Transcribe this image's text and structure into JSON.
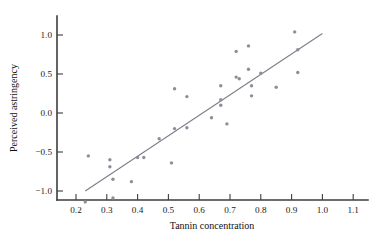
{
  "chart_data": {
    "type": "scatter",
    "title": "",
    "xlabel": "Tannin concentration",
    "ylabel": "Perceived astringency",
    "xlim": [
      0.15,
      1.17
    ],
    "ylim": [
      -1.25,
      1.18
    ],
    "xticks": [
      0.2,
      0.3,
      0.4,
      0.5,
      0.6,
      0.7,
      0.8,
      0.9,
      1.0,
      1.1
    ],
    "xticklabels": [
      "0.2",
      "0.3",
      "0.4",
      "0.5",
      "0.6",
      "0.7",
      "0.8",
      "0.9",
      "1.0",
      "1.1"
    ],
    "yticks": [
      1.0,
      0.5,
      0.0,
      -0.5,
      -1.0
    ],
    "yticklabels": [
      "1.0",
      "0.5",
      "0.0",
      "−0.5",
      "−1.0"
    ],
    "grid": false,
    "legend": false,
    "point_color": "#8b8f9a",
    "line_color": "#7b7f8a",
    "axis_color": "#3d3d3d",
    "points": [
      {
        "x": 0.24,
        "y": -0.55
      },
      {
        "x": 0.23,
        "y": -1.14
      },
      {
        "x": 0.31,
        "y": -0.6
      },
      {
        "x": 0.31,
        "y": -0.69
      },
      {
        "x": 0.32,
        "y": -0.85
      },
      {
        "x": 0.32,
        "y": -1.09
      },
      {
        "x": 0.38,
        "y": -0.88
      },
      {
        "x": 0.4,
        "y": -0.57
      },
      {
        "x": 0.42,
        "y": -0.57
      },
      {
        "x": 0.47,
        "y": -0.33
      },
      {
        "x": 0.51,
        "y": -0.64
      },
      {
        "x": 0.52,
        "y": 0.31
      },
      {
        "x": 0.52,
        "y": -0.2
      },
      {
        "x": 0.56,
        "y": 0.21
      },
      {
        "x": 0.56,
        "y": -0.19
      },
      {
        "x": 0.64,
        "y": -0.06
      },
      {
        "x": 0.67,
        "y": 0.35
      },
      {
        "x": 0.67,
        "y": 0.17
      },
      {
        "x": 0.67,
        "y": 0.1
      },
      {
        "x": 0.69,
        "y": -0.14
      },
      {
        "x": 0.72,
        "y": 0.79
      },
      {
        "x": 0.72,
        "y": 0.46
      },
      {
        "x": 0.73,
        "y": 0.44
      },
      {
        "x": 0.76,
        "y": 0.86
      },
      {
        "x": 0.76,
        "y": 0.56
      },
      {
        "x": 0.77,
        "y": 0.35
      },
      {
        "x": 0.77,
        "y": 0.22
      },
      {
        "x": 0.8,
        "y": 0.51
      },
      {
        "x": 0.85,
        "y": 0.33
      },
      {
        "x": 0.91,
        "y": 1.04
      },
      {
        "x": 0.92,
        "y": 0.81
      },
      {
        "x": 0.92,
        "y": 0.52
      }
    ],
    "fit_line": {
      "x0": 0.23,
      "y0": -1.0,
      "x1": 1.0,
      "y1": 1.02
    }
  }
}
